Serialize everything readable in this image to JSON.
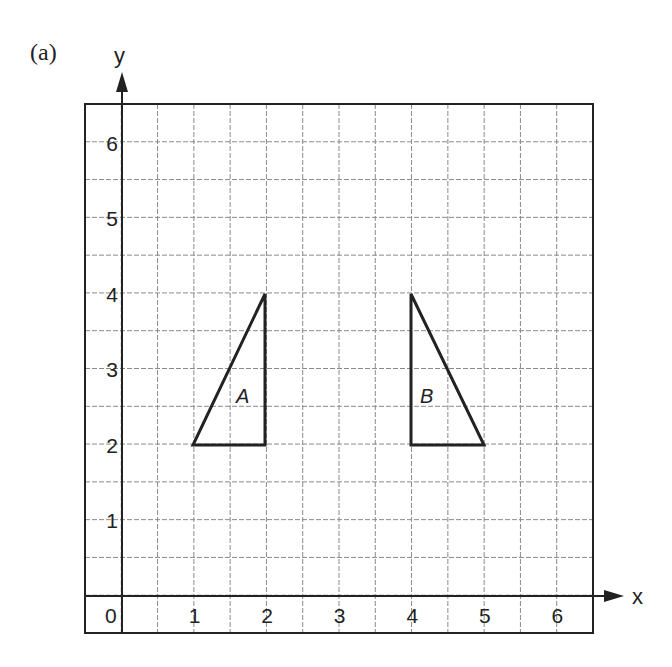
{
  "figure": {
    "part_label": "(a)",
    "x_axis_label": "x",
    "y_axis_label": "y",
    "x_ticks": [
      "1",
      "2",
      "3",
      "4",
      "5",
      "6"
    ],
    "y_ticks": [
      "1",
      "2",
      "3",
      "4",
      "5",
      "6"
    ],
    "origin_label": "0",
    "colors": {
      "ink": "#222222",
      "grid": "#8a8a8a",
      "background": "#ffffff"
    }
  },
  "chart_data": {
    "type": "coordinate-grid",
    "title": "(a)",
    "xlabel": "x",
    "ylabel": "y",
    "xlim": [
      -0.5,
      6.5
    ],
    "ylim": [
      -0.5,
      6.5
    ],
    "grid": true,
    "grid_spacing": 0.5,
    "shapes": [
      {
        "name": "A",
        "type": "triangle",
        "vertices": [
          [
            1,
            2
          ],
          [
            2,
            2
          ],
          [
            2,
            4
          ]
        ]
      },
      {
        "name": "B",
        "type": "triangle",
        "vertices": [
          [
            4,
            2
          ],
          [
            5,
            2
          ],
          [
            4,
            4
          ]
        ]
      }
    ]
  }
}
